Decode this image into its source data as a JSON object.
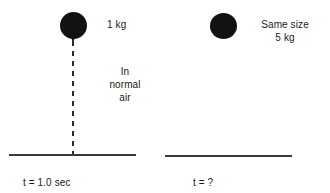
{
  "figure": {
    "background_color": "#ffffff",
    "ink_color": "#121212"
  },
  "panels": [
    {
      "id": "left",
      "ball": {
        "name": "falling-ball-1kg",
        "mass_label": "1 kg",
        "color": "#121212"
      },
      "medium_label_lines": [
        "In",
        "normal",
        "air"
      ],
      "trajectory": {
        "style": "dashed",
        "color": "#2b2b2b"
      },
      "ground_line": true,
      "time_label": "t = 1.0 sec"
    },
    {
      "id": "right",
      "ball": {
        "name": "falling-ball-5kg",
        "mass_label": "5 kg",
        "color": "#121212"
      },
      "size_note": "Same size",
      "trajectory": {
        "style": "none"
      },
      "ground_line": true,
      "time_label": "t = ?"
    }
  ],
  "left": {
    "mass": "1 kg",
    "medium_line_1": "In",
    "medium_line_2": "normal",
    "medium_line_3": "air",
    "time": "t = 1.0 sec"
  },
  "right": {
    "size_note": "Same size",
    "mass": "5 kg",
    "time": "t = ?"
  }
}
